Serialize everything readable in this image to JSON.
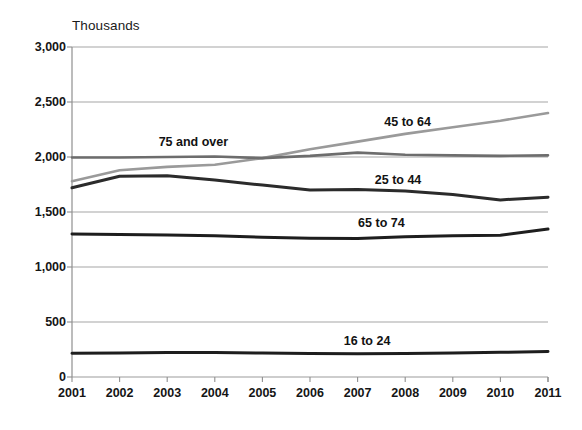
{
  "chart_data": {
    "type": "line",
    "title": "",
    "subtitle": "",
    "unit_label": "Thousands",
    "xlabel": "",
    "ylabel": "",
    "grid": true,
    "legend_position": "inline-annotations",
    "xlim": [
      2001,
      2011
    ],
    "ylim": [
      0,
      3000
    ],
    "ytick_values": [
      0,
      500,
      1000,
      1500,
      2000,
      2500,
      3000
    ],
    "ytick_labels": [
      "0",
      "500",
      "1,000",
      "1,500",
      "2,000",
      "2,500",
      "3,000"
    ],
    "categories": [
      2001,
      2002,
      2003,
      2004,
      2005,
      2006,
      2007,
      2008,
      2009,
      2010,
      2011
    ],
    "xtick_labels": [
      "2001",
      "2002",
      "2003",
      "2004",
      "2005",
      "2006",
      "2007",
      "2008",
      "2009",
      "2010",
      "2011"
    ],
    "series": [
      {
        "name": "45 to 64",
        "color": "#9a9a9a",
        "width": 2.6,
        "label_x": 2008.05,
        "label_y": 2320,
        "values": [
          1780,
          1880,
          1910,
          1930,
          1990,
          2070,
          2140,
          2210,
          2270,
          2330,
          2400
        ]
      },
      {
        "name": "75 and over",
        "color": "#6d6d6d",
        "width": 2.6,
        "label_x": 2003.55,
        "label_y": 2135,
        "values": [
          1995,
          1995,
          2000,
          2005,
          1990,
          2010,
          2040,
          2020,
          2015,
          2010,
          2015
        ]
      },
      {
        "name": "25 to 44",
        "color": "#2b2b2b",
        "width": 3.0,
        "label_x": 2007.85,
        "label_y": 1790,
        "values": [
          1720,
          1825,
          1830,
          1790,
          1745,
          1700,
          1705,
          1690,
          1660,
          1610,
          1635
        ]
      },
      {
        "name": "65 to 74",
        "color": "#1e1e1e",
        "width": 3.0,
        "label_x": 2007.5,
        "label_y": 1400,
        "values": [
          1300,
          1295,
          1290,
          1285,
          1270,
          1262,
          1260,
          1275,
          1285,
          1288,
          1345
        ]
      },
      {
        "name": "16 to 24",
        "color": "#1e1e1e",
        "width": 3.0,
        "label_x": 2007.2,
        "label_y": 330,
        "values": [
          215,
          218,
          222,
          222,
          218,
          214,
          212,
          214,
          218,
          224,
          232
        ]
      }
    ]
  },
  "axes": {
    "plot_left_px": 72,
    "plot_right_px": 548,
    "plot_top_px": 47,
    "plot_bottom_px": 377,
    "axis_color": "#8f8f8f",
    "grid_color": "#9b9b9b",
    "tick_color": "#8f8f8f"
  }
}
